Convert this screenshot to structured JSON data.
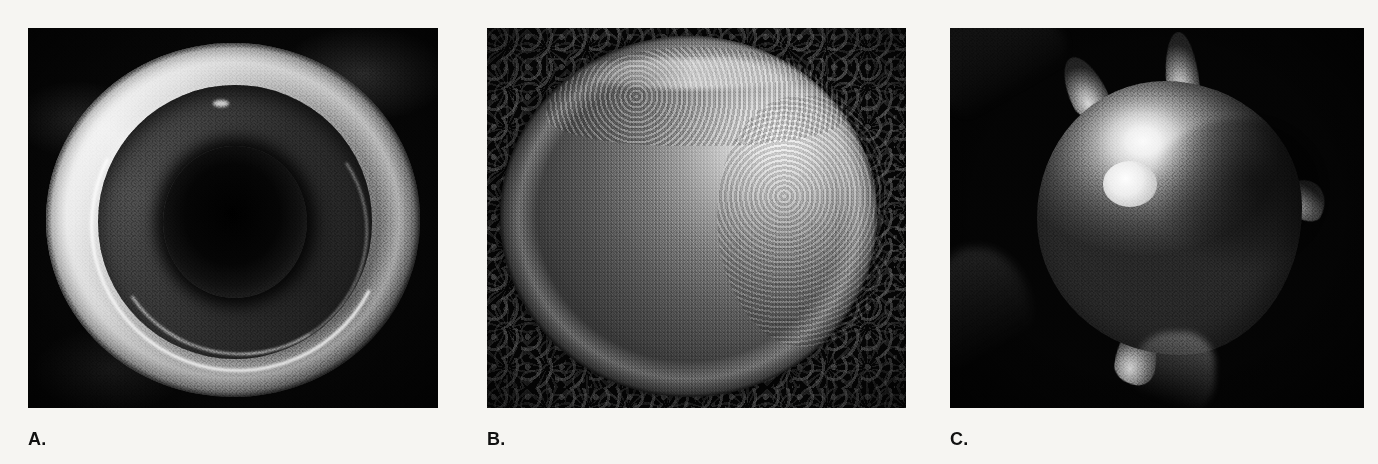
{
  "figure": {
    "background_color": "#f6f5f2",
    "panel_background_color": "#050505",
    "caption_color": "#111111",
    "panels": [
      {
        "id": "panel-a",
        "caption": "A.",
        "subject": "red-blood-cell-discocyte",
        "description": "Scanning electron micrograph of a biconcave disc-shaped red blood cell viewed face-on, showing a raised outer torus and a deep dark central depression.",
        "frame": {
          "x": 28,
          "y": 28,
          "width": 410,
          "height": 380
        },
        "caption_position": {
          "x": 28,
          "y": 430
        }
      },
      {
        "id": "panel-b",
        "caption": "B.",
        "subject": "red-blood-cell-spherocyte",
        "description": "Scanning electron micrograph of a rounded, swollen spherical red blood cell resting on a dark mesh filter substrate, brightly lit from the upper right.",
        "frame": {
          "x": 487,
          "y": 28,
          "width": 419,
          "height": 380
        },
        "caption_position": {
          "x": 487,
          "y": 430
        }
      },
      {
        "id": "panel-c",
        "caption": "C.",
        "subject": "red-blood-cell-echinocyte",
        "description": "Scanning electron micrograph of a crenated echinocyte red blood cell bearing several blunt finger-like surface projections against a black background.",
        "frame": {
          "x": 950,
          "y": 28,
          "width": 414,
          "height": 380
        },
        "caption_position": {
          "x": 950,
          "y": 430
        }
      }
    ]
  }
}
